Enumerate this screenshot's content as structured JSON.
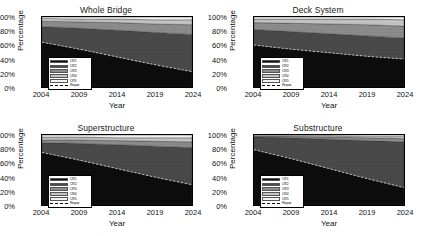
{
  "figure": {
    "width": 424,
    "height": 236,
    "background": "#ffffff",
    "layout": "2x2 grid of stacked area charts"
  },
  "legend": {
    "entries": [
      {
        "label": "CR1",
        "color": "#0d0d0d",
        "type": "area"
      },
      {
        "label": "CR2",
        "color": "#4a4a4a",
        "type": "area"
      },
      {
        "label": "CR3",
        "color": "#8c8c8c",
        "type": "area"
      },
      {
        "label": "CR4",
        "color": "#c4c4c4",
        "type": "area"
      },
      {
        "label": "CR5",
        "color": "#f2f2f2",
        "type": "area"
      },
      {
        "label": "Repair",
        "color": "#000000",
        "type": "dashed-line"
      }
    ]
  },
  "chart_data": [
    {
      "type": "area",
      "panel": "top-left",
      "title": "Whole Bridge",
      "xlabel": "Year",
      "ylabel": "Percentage",
      "x": [
        2004,
        2009,
        2014,
        2019,
        2024
      ],
      "xlim": [
        2004,
        2024
      ],
      "ylim": [
        0,
        100
      ],
      "xticks": [
        "2004",
        "2009",
        "2014",
        "2019",
        "2024"
      ],
      "yticks": [
        "0%",
        "20%",
        "40%",
        "60%",
        "80%",
        "100%"
      ],
      "grid": false,
      "stacked": true,
      "series": [
        {
          "name": "CR1",
          "color": "#0d0d0d",
          "values": [
            64,
            54,
            43,
            32,
            22
          ]
        },
        {
          "name": "CR2",
          "color": "#4a4a4a",
          "values": [
            22,
            30,
            38,
            46,
            53
          ]
        },
        {
          "name": "CR3",
          "color": "#8c8c8c",
          "values": [
            8,
            9,
            11,
            12,
            14
          ]
        },
        {
          "name": "CR4",
          "color": "#c4c4c4",
          "values": [
            4,
            4,
            5,
            6,
            7
          ]
        },
        {
          "name": "CR5",
          "color": "#f2f2f2",
          "values": [
            2,
            3,
            3,
            4,
            4
          ]
        }
      ],
      "repair_line": {
        "name": "Repair",
        "values": [
          64,
          54,
          43,
          32,
          22
        ]
      }
    },
    {
      "type": "area",
      "panel": "top-right",
      "title": "Deck System",
      "xlabel": "Year",
      "ylabel": "Percentage",
      "x": [
        2004,
        2009,
        2014,
        2019,
        2024
      ],
      "xlim": [
        2004,
        2024
      ],
      "ylim": [
        0,
        100
      ],
      "xticks": [
        "2004",
        "2009",
        "2014",
        "2019",
        "2024"
      ],
      "yticks": [
        "0%",
        "20%",
        "40%",
        "60%",
        "80%",
        "100%"
      ],
      "grid": false,
      "stacked": true,
      "series": [
        {
          "name": "CR1",
          "color": "#0d0d0d",
          "values": [
            60,
            54,
            49,
            44,
            40
          ]
        },
        {
          "name": "CR2",
          "color": "#4a4a4a",
          "values": [
            22,
            25,
            27,
            29,
            30
          ]
        },
        {
          "name": "CR3",
          "color": "#8c8c8c",
          "values": [
            10,
            12,
            14,
            16,
            17
          ]
        },
        {
          "name": "CR4",
          "color": "#c4c4c4",
          "values": [
            5,
            6,
            7,
            8,
            9
          ]
        },
        {
          "name": "CR5",
          "color": "#f2f2f2",
          "values": [
            3,
            3,
            3,
            3,
            4
          ]
        }
      ],
      "repair_line": {
        "name": "Repair",
        "values": [
          60,
          54,
          49,
          44,
          40
        ]
      }
    },
    {
      "type": "area",
      "panel": "bottom-left",
      "title": "Superstructure",
      "xlabel": "Year",
      "ylabel": "Percentage",
      "x": [
        2004,
        2009,
        2014,
        2019,
        2024
      ],
      "xlim": [
        2004,
        2024
      ],
      "ylim": [
        0,
        100
      ],
      "xticks": [
        "2004",
        "2009",
        "2014",
        "2019",
        "2024"
      ],
      "yticks": [
        "0%",
        "20%",
        "40%",
        "60%",
        "80%",
        "100%"
      ],
      "grid": false,
      "stacked": true,
      "series": [
        {
          "name": "CR1",
          "color": "#0d0d0d",
          "values": [
            75,
            64,
            52,
            40,
            29
          ]
        },
        {
          "name": "CR2",
          "color": "#4a4a4a",
          "values": [
            14,
            24,
            34,
            44,
            53
          ]
        },
        {
          "name": "CR3",
          "color": "#8c8c8c",
          "values": [
            4,
            5,
            6,
            7,
            8
          ]
        },
        {
          "name": "CR4",
          "color": "#c4c4c4",
          "values": [
            4,
            4,
            4,
            5,
            6
          ]
        },
        {
          "name": "CR5",
          "color": "#f2f2f2",
          "values": [
            3,
            3,
            4,
            4,
            4
          ]
        }
      ],
      "repair_line": {
        "name": "Repair",
        "values": [
          75,
          64,
          52,
          40,
          29
        ]
      }
    },
    {
      "type": "area",
      "panel": "bottom-right",
      "title": "Substructure",
      "xlabel": "Year",
      "ylabel": "Percentage",
      "x": [
        2004,
        2009,
        2014,
        2019,
        2024
      ],
      "xlim": [
        2004,
        2024
      ],
      "ylim": [
        0,
        100
      ],
      "xticks": [
        "2004",
        "2009",
        "2014",
        "2019",
        "2024"
      ],
      "yticks": [
        "0%",
        "20%",
        "40%",
        "60%",
        "80%",
        "100%"
      ],
      "grid": false,
      "stacked": true,
      "series": [
        {
          "name": "CR1",
          "color": "#0d0d0d",
          "values": [
            79,
            66,
            52,
            38,
            25
          ]
        },
        {
          "name": "CR2",
          "color": "#4a4a4a",
          "values": [
            18,
            30,
            42,
            54,
            65
          ]
        },
        {
          "name": "CR3",
          "color": "#8c8c8c",
          "values": [
            1,
            2,
            3,
            4,
            5
          ]
        },
        {
          "name": "CR4",
          "color": "#c4c4c4",
          "values": [
            1,
            1,
            2,
            2,
            3
          ]
        },
        {
          "name": "CR5",
          "color": "#f2f2f2",
          "values": [
            1,
            1,
            1,
            2,
            2
          ]
        }
      ],
      "repair_line": {
        "name": "Repair",
        "values": [
          79,
          66,
          52,
          38,
          25
        ]
      }
    }
  ]
}
